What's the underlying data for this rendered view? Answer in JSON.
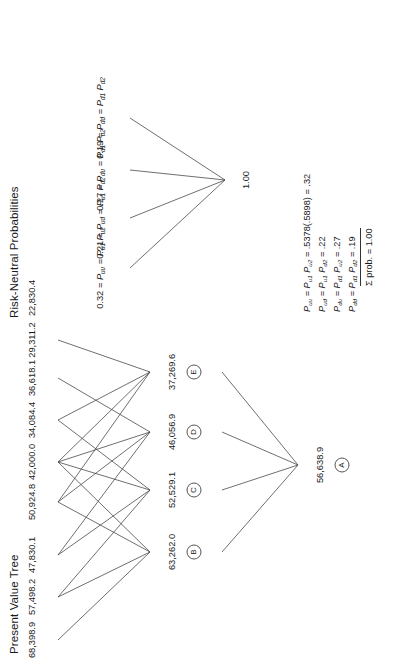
{
  "present_value_tree": {
    "title": "Present Value Tree",
    "root": {
      "value": "56,638.9",
      "badge": "A"
    },
    "level1": [
      {
        "value": "63,262.0",
        "badge": "B"
      },
      {
        "value": "52,529.1",
        "badge": "C"
      },
      {
        "value": "46,056.9",
        "badge": "D"
      },
      {
        "value": "37,269.6",
        "badge": "E"
      }
    ],
    "leaves": [
      "68,398.9",
      "57,498.2",
      "47,830.1",
      "50,924.8",
      "42,000.0",
      "34,084.4",
      "36,618.1",
      "29,311.2",
      "22,830.4"
    ]
  },
  "risk_neutral_probabilities": {
    "title": "Risk-Neutral Probabilities",
    "root": "1.00",
    "branches": [
      "0.32 = P",
      "0.21 = P",
      "0.27 = P",
      "0.19 = P"
    ],
    "branch_text": [
      {
        "prob": "0.32",
        "name": "uu",
        "f1": "u1",
        "f2": "u2"
      },
      {
        "prob": "0.21",
        "name": "ud",
        "f1": "u1",
        "f2": "d2"
      },
      {
        "prob": "0.27",
        "name": "du",
        "f1": "d1",
        "f2": "u2"
      },
      {
        "prob": "0.19",
        "name": "dd",
        "f1": "d1",
        "f2": "d2"
      }
    ],
    "formulas": [
      {
        "lhs": "uu",
        "f1": "u1",
        "f2": "u2",
        "calc": " = .5378(.5898) = .32"
      },
      {
        "lhs": "ud",
        "f1": "u1",
        "f2": "d2",
        "calc": " = .22"
      },
      {
        "lhs": "du",
        "f1": "d1",
        "f2": "u2",
        "calc": " = .27"
      },
      {
        "lhs": "dd",
        "f1": "d1",
        "f2": "d2",
        "calc": " = .19"
      }
    ],
    "sum_line": "Σ prob. = 1.00"
  },
  "colors": {
    "line": "#4a4a4a",
    "text": "#1a1a1a",
    "background": "#ffffff"
  }
}
